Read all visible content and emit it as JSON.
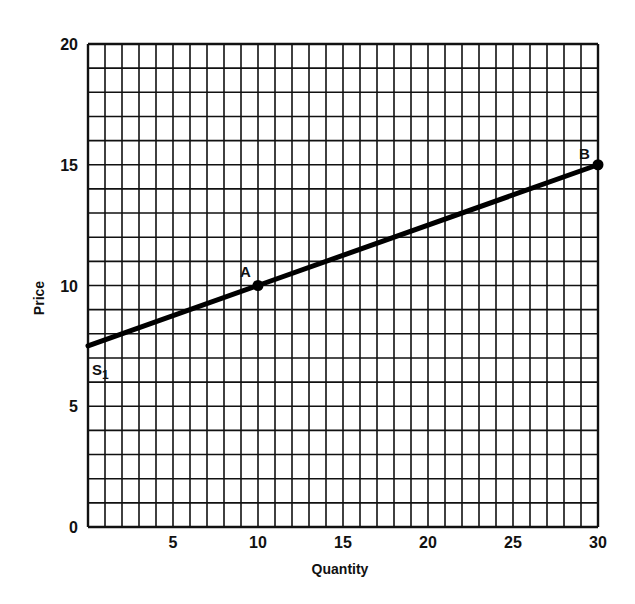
{
  "chart_data": {
    "type": "line",
    "title": "",
    "xlabel": "Quantity",
    "ylabel": "Price",
    "xlim": [
      0,
      30
    ],
    "ylim": [
      0,
      20
    ],
    "x_ticks": [
      0,
      5,
      10,
      15,
      20,
      25,
      30
    ],
    "y_ticks": [
      0,
      5,
      10,
      15,
      20
    ],
    "grid": true,
    "grid_minor_step_x": 1,
    "grid_minor_step_y": 1,
    "series": [
      {
        "name": "S1",
        "x": [
          0,
          10,
          30
        ],
        "y": [
          7.5,
          10,
          15
        ]
      }
    ],
    "points": [
      {
        "label": "A",
        "x": 10,
        "y": 10
      },
      {
        "label": "B",
        "x": 30,
        "y": 15
      }
    ],
    "annotations": [
      {
        "text": "S1",
        "x": 0,
        "y": 7.5
      }
    ]
  },
  "labels": {
    "xlabel": "Quantity",
    "ylabel": "Price",
    "point_a": "A",
    "point_b": "B",
    "curve": "S",
    "curve_sub": "1",
    "xticks": [
      "5",
      "10",
      "15",
      "20",
      "25",
      "30"
    ],
    "yticks": [
      "0",
      "5",
      "10",
      "15",
      "20"
    ]
  }
}
